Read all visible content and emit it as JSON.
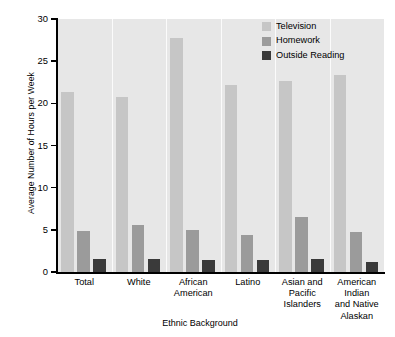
{
  "chart_data": {
    "type": "bar",
    "title": "",
    "xlabel": "Ethnic Background",
    "ylabel": "Average Number of Hours per Week",
    "ylim": [
      0,
      30
    ],
    "ytick_step": 5,
    "yticks": [
      0,
      5,
      10,
      15,
      20,
      25,
      30
    ],
    "grid": false,
    "legend_position": "top-right",
    "categories": [
      "Total",
      "White",
      "African American",
      "Latino",
      "Asian and Pacific Islanders",
      "American Indian and Native Alaskan"
    ],
    "category_lines": [
      [
        "Total"
      ],
      [
        "White"
      ],
      [
        "African",
        "American"
      ],
      [
        "Latino"
      ],
      [
        "Asian and",
        "Pacific",
        "Islanders"
      ],
      [
        "American",
        "Indian",
        "and Native",
        "Alaskan"
      ]
    ],
    "series": [
      {
        "name": "Television",
        "color": "#c6c6c6",
        "values": [
          21.4,
          20.8,
          27.8,
          22.2,
          22.7,
          23.4
        ]
      },
      {
        "name": "Homework",
        "color": "#9b9b9b",
        "values": [
          4.9,
          5.6,
          5.0,
          4.4,
          6.5,
          4.7
        ]
      },
      {
        "name": "Outside Reading",
        "color": "#3a3a3a",
        "values": [
          1.5,
          1.5,
          1.4,
          1.4,
          1.5,
          1.2
        ]
      }
    ]
  },
  "colors": {
    "plot_background": "#e7e7e7",
    "page_background": "#ffffff",
    "axis": "#000000",
    "separator": "#fbfbfb"
  }
}
